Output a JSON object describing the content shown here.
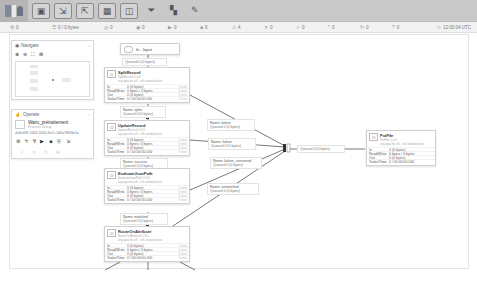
{
  "toolbar": {
    "logo": "nifi",
    "buttons": [
      {
        "name": "processor",
        "icon": "▣"
      },
      {
        "name": "input-port",
        "icon": "⇲"
      },
      {
        "name": "output-port",
        "icon": "⇱"
      },
      {
        "name": "process-group",
        "icon": "▦"
      },
      {
        "name": "remote-process-group",
        "icon": "◫"
      },
      {
        "name": "funnel",
        "icon": "⏷"
      },
      {
        "name": "template",
        "icon": "▚"
      },
      {
        "name": "label",
        "icon": "✎"
      }
    ]
  },
  "status": {
    "items": [
      {
        "icon": "⚙",
        "value": "0"
      },
      {
        "icon": "☰",
        "value": "0 / 0 bytes"
      },
      {
        "icon": "◎",
        "value": "0"
      },
      {
        "icon": "◉",
        "value": "0"
      },
      {
        "icon": "▶",
        "value": "0"
      },
      {
        "icon": "■",
        "value": "6"
      },
      {
        "icon": "⚠",
        "value": "4"
      },
      {
        "icon": "✕",
        "value": "0"
      },
      {
        "icon": "✓",
        "value": "0"
      },
      {
        "icon": "*",
        "value": "0"
      },
      {
        "icon": "↻",
        "value": "0"
      },
      {
        "icon": "?",
        "value": "0"
      }
    ],
    "timestamp": "12:00:04 UTC"
  },
  "navigate": {
    "title": "Navigate",
    "tools": [
      "⊕",
      "⊖",
      "⛶",
      "⊞"
    ]
  },
  "operate": {
    "title": "Operate",
    "group_name": "Wazo_prétraitement",
    "group_type": "Process Group",
    "group_id": "4a5e4ff5-0163-1000-6a7c-5d5e7f8d3e1a",
    "actions": [
      "⚙",
      "ϟ",
      "ϟ̸",
      "▶",
      "■",
      "⎘",
      "⇲"
    ],
    "actions2": [
      "✓",
      "✕",
      "↻",
      "⊟"
    ]
  },
  "nodes": {
    "input_port": {
      "label": "In - Input"
    },
    "conn_in": {
      "name": "",
      "queued": "Queued 0 (0 bytes)"
    },
    "split_record": {
      "name": "SplitRecord",
      "type": "SplitRecord 1.6.0",
      "bundle": "org.apache.nifi - nifi-standard-nar",
      "in": "0 (0 bytes)",
      "rw": "0 bytes / 0 bytes",
      "out": "0 (0 bytes)",
      "tasks": "0 / 00:00:00.000",
      "period": "5 min"
    },
    "conn_splits": {
      "name": "Name: splits",
      "queued": "Queued 0 (0 bytes)"
    },
    "update_record": {
      "name": "UpdateRecord",
      "type": "UpdateRecord 1.6.0",
      "bundle": "org.apache.nifi - nifi-standard-nar",
      "in": "0 (0 bytes)",
      "rw": "0 bytes / 0 bytes",
      "out": "0 (0 bytes)",
      "tasks": "0 / 00:00:00.000",
      "period": "5 min"
    },
    "conn_success": {
      "name": "Name: success",
      "queued": "Queued 0 (0 bytes)"
    },
    "evaluate": {
      "name": "EvaluateJsonPath",
      "type": "EvaluateJsonPath 1.6.0",
      "bundle": "org.apache.nifi - nifi-standard-nar",
      "in": "0 (0 bytes)",
      "rw": "0 bytes / 0 bytes",
      "out": "0 (0 bytes)",
      "tasks": "0 / 00:00:00.000",
      "period": "5 min"
    },
    "conn_matched": {
      "name": "Name: matched",
      "queued": "Queued 0 (0 bytes)"
    },
    "route": {
      "name": "RouteOnAttribute",
      "type": "RouteOnAttribute 1.6.0",
      "bundle": "org.apache.nifi - nifi-standard-nar",
      "in": "0 (0 bytes)",
      "rw": "0 bytes / 0 bytes",
      "out": "0 (0 bytes)",
      "tasks": "0 / 00:00:00.000",
      "period": "5 min"
    },
    "conn_failure": {
      "name": "Name: failure",
      "queued": "Queued 0 (0 bytes)"
    },
    "conn_failure2": {
      "name": "Name: failure",
      "queued": "Queued 0 (0 bytes)"
    },
    "conn_failure3": {
      "name": "Name: failure_converted",
      "queued": "Queued 0 (0 bytes)"
    },
    "conn_unmatched": {
      "name": "Name: unmatched",
      "queued": "Queued 0 (0 bytes)"
    },
    "conn_funnel": {
      "name": "",
      "queued": "Queued 0 (0 bytes)"
    },
    "put_file": {
      "name": "PutFile",
      "type": "PutFile 1.6.0",
      "bundle": "org.apache.nifi - nifi-standard-nar",
      "in": "0 (0 bytes)",
      "rw": "0 bytes / 0 bytes",
      "out": "0 (0 bytes)",
      "tasks": "0 / 00:00:00.000",
      "period": "5 min"
    }
  },
  "labels": {
    "in": "In",
    "rw": "Read/Write",
    "out": "Out",
    "tasks": "Tasks/Time"
  },
  "colors": {
    "toolbar": "#c9c9c9",
    "queue_accent": "#33aaaa"
  }
}
